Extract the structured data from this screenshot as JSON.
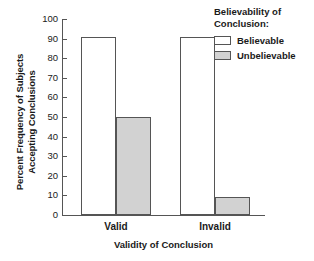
{
  "chart_data": {
    "type": "bar",
    "title": "",
    "xlabel": "Validity of Conclusion",
    "ylabel": "Percent Frequency of Subjects\nAccepting Conclusions",
    "categories": [
      "Valid",
      "Invalid"
    ],
    "series": [
      {
        "name": "Believable",
        "values": [
          91,
          91
        ],
        "fill": "#ffffff"
      },
      {
        "name": "Unbelievable",
        "values": [
          50,
          9
        ],
        "fill": "#d2d2d2"
      }
    ],
    "ylim": [
      0,
      100
    ],
    "yticks": [
      0,
      10,
      20,
      30,
      40,
      50,
      60,
      70,
      80,
      90,
      100
    ],
    "ytick_labels": [
      "0",
      "10",
      "20",
      "30",
      "40",
      "50",
      "60",
      "70",
      "80",
      "90",
      "100"
    ],
    "grid": false,
    "legend_position": "upper right",
    "legend_title": "Believability of\nConclusion:"
  },
  "legend": {
    "title": "Believability of\nConclusion:",
    "entries": [
      {
        "label": "Believable",
        "swatch": "open-box-swatch"
      },
      {
        "label": "Unbelievable",
        "swatch": "filled-box-swatch"
      }
    ]
  },
  "axes": {
    "x_title": "Validity of Conclusion",
    "y_title": "Percent Frequency of Subjects\nAccepting Conclusions",
    "group_labels": [
      "Valid",
      "Invalid"
    ]
  },
  "colors": {
    "axis": "#555555",
    "bar_open": "#ffffff",
    "bar_filled": "#d2d2d2",
    "text": "#1a1a1a",
    "background": "#ffffff"
  }
}
